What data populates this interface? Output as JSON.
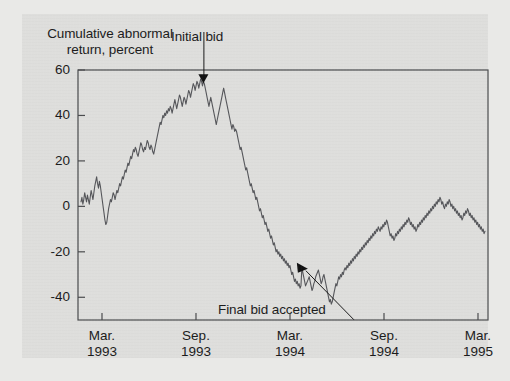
{
  "figure": {
    "background_color": "#dededc",
    "page_color": "#e9e9e7",
    "line_color": "#55565a"
  },
  "axis_title": "Cumulative abnormal return, percent",
  "annotations": {
    "initial_bid": {
      "label": "Initial bid",
      "marker": "down-triangle",
      "x_value": "1993-09-20",
      "y_value": 55
    },
    "final_bid": {
      "label": "Final bid accepted",
      "marker": "right-triangle",
      "x_value": "1994-03-05",
      "y_value": -27
    }
  },
  "chart_data": {
    "type": "line",
    "title": "Cumulative abnormal return, percent",
    "xlabel": "",
    "ylabel": "Cumulative abnormal return, percent",
    "ylim": [
      -50,
      60
    ],
    "xlim": [
      "Mar. 1993",
      "Mar. 1995"
    ],
    "grid": false,
    "legend": "none",
    "yticks": [
      60,
      40,
      20,
      0,
      -20,
      -40
    ],
    "ytick_labels": [
      "60",
      "40",
      "20",
      "0",
      "-20",
      "-40"
    ],
    "xticks": [
      "Mar. 1993",
      "Sep. 1993",
      "Mar. 1994",
      "Sep. 1994",
      "Mar. 1995"
    ],
    "xtick_labels": [
      {
        "month": "Mar.",
        "year": "1993"
      },
      {
        "month": "Sep.",
        "year": "1993"
      },
      {
        "month": "Mar.",
        "year": "1994"
      },
      {
        "month": "Sep.",
        "year": "1994"
      },
      {
        "month": "Mar.",
        "year": "1995"
      }
    ],
    "series": [
      {
        "name": "Cumulative abnormal return",
        "values": [
          2,
          4,
          1,
          3,
          6,
          4,
          2,
          5,
          3,
          1,
          4,
          7,
          5,
          3,
          6,
          9,
          11,
          13,
          10,
          8,
          11,
          9,
          6,
          3,
          0,
          -3,
          -6,
          -8,
          -7,
          -4,
          -1,
          1,
          3,
          2,
          4,
          6,
          5,
          3,
          5,
          7,
          6,
          8,
          10,
          9,
          11,
          13,
          12,
          14,
          16,
          15,
          17,
          19,
          18,
          20,
          22,
          21,
          23,
          25,
          24,
          26,
          25,
          23,
          22,
          24,
          26,
          28,
          27,
          25,
          24,
          26,
          25,
          27,
          29,
          28,
          26,
          25,
          27,
          26,
          24,
          23,
          25,
          27,
          29,
          31,
          33,
          35,
          37,
          36,
          38,
          40,
          39,
          41,
          40,
          42,
          41,
          43,
          42,
          44,
          43,
          41,
          43,
          45,
          47,
          45,
          43,
          45,
          47,
          49,
          48,
          46,
          44,
          46,
          48,
          47,
          45,
          47,
          49,
          51,
          50,
          48,
          50,
          52,
          54,
          53,
          51,
          53,
          55,
          54,
          52,
          54,
          56,
          55,
          53,
          55,
          54,
          52,
          50,
          48,
          46,
          44,
          46,
          48,
          46,
          44,
          42,
          40,
          38,
          36,
          38,
          40,
          42,
          44,
          46,
          48,
          50,
          52,
          50,
          48,
          46,
          44,
          42,
          40,
          38,
          36,
          34,
          36,
          35,
          33,
          34,
          33,
          31,
          29,
          27,
          25,
          26,
          24,
          22,
          20,
          18,
          16,
          17,
          15,
          13,
          11,
          9,
          10,
          8,
          6,
          7,
          5,
          3,
          4,
          2,
          0,
          -2,
          -1,
          -3,
          -5,
          -4,
          -6,
          -8,
          -7,
          -9,
          -11,
          -10,
          -12,
          -14,
          -13,
          -15,
          -17,
          -16,
          -18,
          -20,
          -19,
          -21,
          -20,
          -22,
          -21,
          -23,
          -22,
          -24,
          -23,
          -25,
          -24,
          -26,
          -25,
          -27,
          -26,
          -28,
          -30,
          -29,
          -31,
          -33,
          -32,
          -34,
          -33,
          -35,
          -34,
          -36,
          -35,
          -27,
          -29,
          -31,
          -33,
          -35,
          -34,
          -33,
          -32,
          -31,
          -33,
          -35,
          -37,
          -36,
          -34,
          -33,
          -31,
          -30,
          -29,
          -28,
          -30,
          -32,
          -34,
          -33,
          -31,
          -30,
          -32,
          -34,
          -36,
          -38,
          -40,
          -42,
          -41,
          -43,
          -42,
          -40,
          -38,
          -36,
          -34,
          -35,
          -33,
          -31,
          -32,
          -30,
          -31,
          -29,
          -30,
          -28,
          -27,
          -28,
          -26,
          -27,
          -25,
          -26,
          -24,
          -25,
          -23,
          -24,
          -22,
          -23,
          -21,
          -22,
          -20,
          -21,
          -19,
          -20,
          -18,
          -19,
          -17,
          -18,
          -16,
          -17,
          -15,
          -16,
          -14,
          -15,
          -13,
          -14,
          -12,
          -13,
          -11,
          -12,
          -10,
          -11,
          -9,
          -10,
          -11,
          -9,
          -10,
          -8,
          -9,
          -7,
          -8,
          -6,
          -7,
          -9,
          -11,
          -13,
          -12,
          -14,
          -13,
          -15,
          -14,
          -12,
          -13,
          -11,
          -12,
          -10,
          -11,
          -9,
          -10,
          -8,
          -9,
          -7,
          -8,
          -6,
          -7,
          -5,
          -6,
          -8,
          -7,
          -9,
          -8,
          -10,
          -9,
          -11,
          -10,
          -8,
          -9,
          -7,
          -8,
          -6,
          -7,
          -5,
          -6,
          -4,
          -5,
          -3,
          -4,
          -2,
          -3,
          -1,
          -2,
          0,
          -1,
          1,
          0,
          2,
          1,
          3,
          2,
          4,
          3,
          1,
          2,
          0,
          -1,
          1,
          0,
          2,
          1,
          3,
          2,
          0,
          1,
          -1,
          0,
          -2,
          -1,
          -3,
          -2,
          -4,
          -3,
          -5,
          -4,
          -6,
          -5,
          -3,
          -4,
          -2,
          -3,
          -1,
          -2,
          -4,
          -3,
          -5,
          -4,
          -6,
          -5,
          -7,
          -6,
          -8,
          -7,
          -9,
          -8,
          -10,
          -9,
          -11,
          -10,
          -12,
          -11
        ]
      }
    ]
  }
}
